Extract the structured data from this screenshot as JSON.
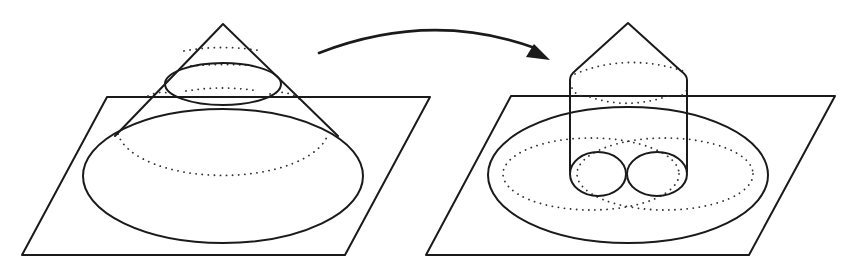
{
  "diagram": {
    "colors": {
      "stroke": "#1a1a1a",
      "background": "#ffffff"
    },
    "left": {
      "plane": [
        [
          22,
          255
        ],
        [
          107,
          96
        ],
        [
          430,
          96
        ],
        [
          345,
          255
        ]
      ],
      "cone_apex": [
        223,
        24
      ],
      "cone_left_base": [
        115,
        136
      ],
      "cone_right_base": [
        338,
        136
      ],
      "small_ellipse": {
        "cx": 223,
        "cy": 79,
        "rx": 57,
        "ry": 25
      },
      "large_ellipse": {
        "cx": 223,
        "cy": 186,
        "rx": 140,
        "ry": 57
      },
      "dotted_ellipses": [
        {
          "cx": 223,
          "cy": 144,
          "rx": 106,
          "ry": 40,
          "half": "top-hidden"
        },
        {
          "cx": 223,
          "cy": 58,
          "rx": 50,
          "ry": 12,
          "half": "back"
        },
        {
          "cx": 223,
          "cy": 93,
          "rx": 65,
          "ry": 12,
          "half": "back"
        }
      ]
    },
    "right": {
      "plane": [
        [
          425,
          255
        ],
        [
          510,
          96
        ],
        [
          835,
          96
        ],
        [
          750,
          255
        ]
      ],
      "cone_apex": [
        628,
        24
      ],
      "cylinder_left_x": 570,
      "cylinder_right_x": 687,
      "cylinder_top_y": 78,
      "cylinder_bottom_y": 172,
      "large_ellipse": {
        "cx": 628,
        "cy": 182,
        "rx": 140,
        "ry": 60
      },
      "small_circles": [
        {
          "cx": 598,
          "cy": 174,
          "rx": 28,
          "ry": 22
        },
        {
          "cx": 657,
          "cy": 174,
          "rx": 30,
          "ry": 22
        }
      ],
      "dotted_ellipses": [
        {
          "cx": 583,
          "cy": 175,
          "rx": 78,
          "ry": 35
        },
        {
          "cx": 671,
          "cy": 175,
          "rx": 78,
          "ry": 35
        },
        {
          "cx": 628,
          "cy": 78,
          "rx": 58,
          "ry": 16
        },
        {
          "cx": 628,
          "cy": 92,
          "rx": 40,
          "ry": 10
        }
      ]
    },
    "arrow": {
      "path": "M 319 53 Q 430 10 535 50",
      "head": [
        [
          548,
          57
        ],
        [
          526,
          56
        ],
        [
          533,
          45
        ]
      ]
    }
  }
}
